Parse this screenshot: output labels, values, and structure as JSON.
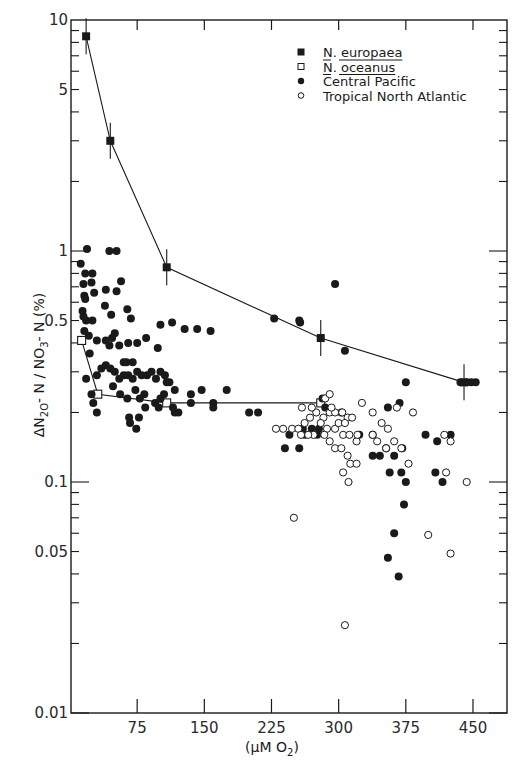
{
  "chart_data": {
    "type": "scatter",
    "title": "",
    "xlabel": "(μM O2)",
    "ylabel": "ΔN2O-N / NO3-N (%)",
    "xlim": [
      0,
      487
    ],
    "ylim": [
      0.01,
      10
    ],
    "yscale": "log",
    "grid": false,
    "legend_position": "upper right",
    "x_ticks": [
      75,
      150,
      225,
      300,
      375,
      450
    ],
    "x_tick_labels": [
      "75",
      "150",
      "225",
      "300",
      "375",
      "450"
    ],
    "y_ticks": [
      0.01,
      0.05,
      0.1,
      0.5,
      1,
      5,
      10
    ],
    "y_tick_labels": [
      "0.01",
      "0.05",
      "0.1",
      "0.5",
      "1",
      "5",
      "10"
    ],
    "series": [
      {
        "name": "N. europaea",
        "marker": "filled-square",
        "connected": true,
        "error_bars": true,
        "points": [
          [
            18,
            8.5
          ],
          [
            45,
            3.0
          ],
          [
            108,
            0.85
          ],
          [
            280,
            0.42
          ],
          [
            440,
            0.27
          ]
        ]
      },
      {
        "name": "N. oceanus",
        "marker": "open-square",
        "connected": true,
        "error_bars": false,
        "points": [
          [
            13,
            0.41
          ],
          [
            31,
            0.24
          ],
          [
            108,
            0.22
          ],
          [
            280,
            0.22
          ]
        ]
      },
      {
        "name": "Central Pacific",
        "marker": "filled-circle",
        "connected": false,
        "points": [
          [
            19,
            1.02
          ],
          [
            12,
            0.88
          ],
          [
            17,
            0.8
          ],
          [
            25,
            0.8
          ],
          [
            15,
            0.72
          ],
          [
            24,
            0.73
          ],
          [
            27,
            0.66
          ],
          [
            16,
            0.64
          ],
          [
            17,
            0.62
          ],
          [
            40,
            0.68
          ],
          [
            52,
            0.67
          ],
          [
            57,
            0.74
          ],
          [
            44,
            1.0
          ],
          [
            52,
            1.0
          ],
          [
            14,
            0.55
          ],
          [
            15,
            0.52
          ],
          [
            18,
            0.5
          ],
          [
            25,
            0.5
          ],
          [
            39,
            0.58
          ],
          [
            46,
            0.53
          ],
          [
            68,
            0.51
          ],
          [
            64,
            0.56
          ],
          [
            16,
            0.45
          ],
          [
            21,
            0.43
          ],
          [
            30,
            0.41
          ],
          [
            40,
            0.41
          ],
          [
            47,
            0.42
          ],
          [
            50,
            0.44
          ],
          [
            22,
            0.36
          ],
          [
            44,
            0.39
          ],
          [
            55,
            0.39
          ],
          [
            65,
            0.4
          ],
          [
            75,
            0.4
          ],
          [
            85,
            0.42
          ],
          [
            98,
            0.38
          ],
          [
            101,
            0.48
          ],
          [
            114,
            0.49
          ],
          [
            128,
            0.46
          ],
          [
            142,
            0.46
          ],
          [
            157,
            0.45
          ],
          [
            60,
            0.33
          ],
          [
            63,
            0.33
          ],
          [
            70,
            0.33
          ],
          [
            18,
            0.28
          ],
          [
            30,
            0.29
          ],
          [
            35,
            0.31
          ],
          [
            40,
            0.32
          ],
          [
            45,
            0.31
          ],
          [
            50,
            0.3
          ],
          [
            55,
            0.28
          ],
          [
            60,
            0.29
          ],
          [
            65,
            0.29
          ],
          [
            70,
            0.28
          ],
          [
            75,
            0.3
          ],
          [
            80,
            0.29
          ],
          [
            86,
            0.29
          ],
          [
            91,
            0.3
          ],
          [
            96,
            0.28
          ],
          [
            101,
            0.3
          ],
          [
            106,
            0.29
          ],
          [
            111,
            0.27
          ],
          [
            117,
            0.25
          ],
          [
            24,
            0.24
          ],
          [
            48,
            0.26
          ],
          [
            56,
            0.24
          ],
          [
            64,
            0.23
          ],
          [
            73,
            0.25
          ],
          [
            78,
            0.23
          ],
          [
            83,
            0.24
          ],
          [
            105,
            0.24
          ],
          [
            26,
            0.22
          ],
          [
            30,
            0.2
          ],
          [
            84,
            0.21
          ],
          [
            117,
            0.2
          ],
          [
            101,
            0.23
          ],
          [
            135,
            0.24
          ],
          [
            135,
            0.22
          ],
          [
            160,
            0.22
          ],
          [
            160,
            0.21
          ],
          [
            66,
            0.19
          ],
          [
            77,
            0.19
          ],
          [
            95,
            0.22
          ],
          [
            99,
            0.21
          ],
          [
            108,
            0.27
          ],
          [
            67,
            0.18
          ],
          [
            74,
            0.17
          ],
          [
            115,
            0.21
          ],
          [
            121,
            0.2
          ],
          [
            147,
            0.25
          ],
          [
            175,
            0.25
          ],
          [
            200,
            0.2
          ],
          [
            210,
            0.2
          ],
          [
            228,
            0.51
          ],
          [
            256,
            0.5
          ],
          [
            257,
            0.49
          ],
          [
            296,
            0.72
          ],
          [
            307,
            0.37
          ],
          [
            260,
            0.17
          ],
          [
            270,
            0.17
          ],
          [
            278,
            0.17
          ],
          [
            245,
            0.16
          ],
          [
            262,
            0.16
          ],
          [
            276,
            0.16
          ],
          [
            256,
            0.14
          ],
          [
            240,
            0.14
          ],
          [
            285,
            0.21
          ],
          [
            303,
            0.2
          ],
          [
            282,
            0.23
          ],
          [
            323,
            0.16
          ],
          [
            338,
            0.16
          ],
          [
            355,
            0.21
          ],
          [
            368,
            0.22
          ],
          [
            375,
            0.27
          ],
          [
            397,
            0.16
          ],
          [
            410,
            0.15
          ],
          [
            425,
            0.16
          ],
          [
            338,
            0.13
          ],
          [
            346,
            0.13
          ],
          [
            357,
            0.11
          ],
          [
            370,
            0.11
          ],
          [
            373,
            0.08
          ],
          [
            375,
            0.1
          ],
          [
            353,
            0.14
          ],
          [
            362,
            0.13
          ],
          [
            371,
            0.14
          ],
          [
            408,
            0.11
          ],
          [
            416,
            0.1
          ],
          [
            362,
            0.06
          ],
          [
            355,
            0.047
          ],
          [
            367,
            0.039
          ],
          [
            436,
            0.27
          ],
          [
            443,
            0.27
          ],
          [
            448,
            0.27
          ],
          [
            453,
            0.27
          ]
        ]
      },
      {
        "name": "Tropical North Atlantic",
        "marker": "open-circle",
        "connected": false,
        "points": [
          [
            230,
            0.17
          ],
          [
            238,
            0.17
          ],
          [
            248,
            0.17
          ],
          [
            255,
            0.17
          ],
          [
            262,
            0.18
          ],
          [
            268,
            0.19
          ],
          [
            275,
            0.2
          ],
          [
            283,
            0.19
          ],
          [
            290,
            0.2
          ],
          [
            296,
            0.2
          ],
          [
            304,
            0.2
          ],
          [
            310,
            0.19
          ],
          [
            315,
            0.19
          ],
          [
            280,
            0.18
          ],
          [
            287,
            0.17
          ],
          [
            296,
            0.17
          ],
          [
            305,
            0.16
          ],
          [
            312,
            0.16
          ],
          [
            320,
            0.15
          ],
          [
            272,
            0.16
          ],
          [
            266,
            0.16
          ],
          [
            258,
            0.16
          ],
          [
            285,
            0.23
          ],
          [
            290,
            0.24
          ],
          [
            292,
            0.21
          ],
          [
            300,
            0.18
          ],
          [
            307,
            0.18
          ],
          [
            321,
            0.16
          ],
          [
            284,
            0.16
          ],
          [
            290,
            0.15
          ],
          [
            296,
            0.14
          ],
          [
            303,
            0.14
          ],
          [
            310,
            0.13
          ],
          [
            313,
            0.12
          ],
          [
            320,
            0.12
          ],
          [
            305,
            0.11
          ],
          [
            311,
            0.1
          ],
          [
            338,
            0.2
          ],
          [
            348,
            0.18
          ],
          [
            355,
            0.17
          ],
          [
            365,
            0.21
          ],
          [
            383,
            0.2
          ],
          [
            326,
            0.22
          ],
          [
            338,
            0.16
          ],
          [
            343,
            0.15
          ],
          [
            353,
            0.14
          ],
          [
            362,
            0.15
          ],
          [
            370,
            0.14
          ],
          [
            378,
            0.12
          ],
          [
            418,
            0.16
          ],
          [
            425,
            0.15
          ],
          [
            420,
            0.11
          ],
          [
            443,
            0.1
          ],
          [
            250,
            0.07
          ],
          [
            400,
            0.059
          ],
          [
            425,
            0.049
          ],
          [
            307,
            0.024
          ],
          [
            259,
            0.21
          ],
          [
            270,
            0.21
          ]
        ]
      }
    ]
  },
  "legend": {
    "items": [
      {
        "marker": "filled-square",
        "label": "N. europaea",
        "underline": true
      },
      {
        "marker": "open-square",
        "label": "N. oceanus",
        "underline": true
      },
      {
        "marker": "filled-circle",
        "label": "Central Pacific",
        "underline": false
      },
      {
        "marker": "open-circle",
        "label": "Tropical North Atlantic",
        "underline": false
      }
    ]
  },
  "axes": {
    "x_title_pre": "(",
    "x_title_mu": "μM O",
    "x_title_sub": "2",
    "x_title_post": ")",
    "y_title_delta": "Δ",
    "y_title_n": "N",
    "y_title_sub1": "2O",
    "y_title_mid": "- N / NO",
    "y_title_sub2": "3",
    "y_title_end": "- N (%)"
  },
  "colors": {
    "ink": "#1a1a1a",
    "background": "#ffffff"
  }
}
